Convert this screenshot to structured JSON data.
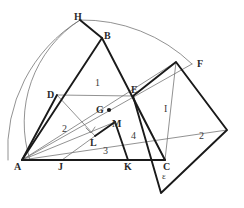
{
  "figure": {
    "type": "geometry-diagram",
    "width": 244,
    "height": 208,
    "background_color": "#ffffff",
    "stroke_color_heavy": "#1a1a1a",
    "stroke_color_light": "#6e6e6e",
    "label_color": "#2b2b2b"
  },
  "points": [
    {
      "name": "A",
      "label": "A",
      "x": 22,
      "y": 160,
      "label_x": 14,
      "label_y": 162,
      "marked": false
    },
    {
      "name": "B",
      "label": "B",
      "x": 102,
      "y": 38,
      "label_x": 104,
      "label_y": 31,
      "marked": false
    },
    {
      "name": "C",
      "label": "C",
      "x": 165,
      "y": 160,
      "label_x": 163,
      "label_y": 162,
      "marked": false
    },
    {
      "name": "D",
      "label": "D",
      "x": 57,
      "y": 95,
      "label_x": 47,
      "label_y": 90,
      "marked": false
    },
    {
      "name": "E",
      "label": "E",
      "x": 133,
      "y": 96,
      "label_x": 131,
      "label_y": 85,
      "marked": false
    },
    {
      "name": "F",
      "label": "F",
      "x": 192,
      "y": 64,
      "label_x": 197,
      "label_y": 59,
      "marked": false
    },
    {
      "name": "G",
      "label": "G",
      "x": 109,
      "y": 110,
      "label_x": 96,
      "label_y": 105,
      "marked": true
    },
    {
      "name": "H",
      "label": "H",
      "x": 80,
      "y": 20,
      "label_x": 74,
      "label_y": 12,
      "marked": false
    },
    {
      "name": "J",
      "label": "J",
      "x": 62,
      "y": 160,
      "label_x": 58,
      "label_y": 162,
      "marked": false
    },
    {
      "name": "K",
      "label": "K",
      "x": 128,
      "y": 160,
      "label_x": 124,
      "label_y": 162,
      "marked": false
    },
    {
      "name": "L",
      "label": "L",
      "x": 95,
      "y": 136,
      "label_x": 90,
      "label_y": 138,
      "marked": false
    },
    {
      "name": "M",
      "label": "M",
      "x": 115,
      "y": 122,
      "label_x": 112,
      "label_y": 119,
      "marked": false
    }
  ],
  "region_labels": [
    {
      "name": "region-1",
      "text": "1",
      "x": 95,
      "y": 78,
      "style": "region"
    },
    {
      "name": "region-2-left",
      "text": "2",
      "x": 62,
      "y": 124,
      "style": "region"
    },
    {
      "name": "region-2-right",
      "text": "2",
      "x": 199,
      "y": 131,
      "style": "region"
    },
    {
      "name": "region-3",
      "text": "3",
      "x": 103,
      "y": 146,
      "style": "region"
    },
    {
      "name": "region-4",
      "text": "4",
      "x": 131,
      "y": 131,
      "style": "region"
    },
    {
      "name": "region-I",
      "text": "I",
      "x": 164,
      "y": 104,
      "style": "region"
    },
    {
      "name": "region-epsilon",
      "text": "ε",
      "x": 162,
      "y": 172,
      "style": "greek"
    }
  ],
  "heavy_paths": [
    {
      "name": "triangle-abc",
      "d": "M 22 160 L 102 38 L 165 160 Z",
      "closed": true
    },
    {
      "name": "square-on-bc-ecfx",
      "d": "M 133 96 L 176 62 L 227 130 L 161 193 Z",
      "closed": true
    },
    {
      "name": "segment-ab-extended-to-h",
      "d": "M 102 38 L 80 20"
    },
    {
      "name": "square-on-ab-partial-ad",
      "d": "M 22 160 L 57 95"
    },
    {
      "name": "segment-k-to-m",
      "d": "M 128 160 L 115 122"
    },
    {
      "name": "segment-m-to-l",
      "d": "M 115 122 L 95 136"
    },
    {
      "name": "base-ac",
      "d": "M 22 160 L 165 160"
    }
  ],
  "light_paths": [
    {
      "name": "arc-outer-from-a",
      "d": "M 8 160 A 152 152 0 0 1 80 20"
    },
    {
      "name": "arc-inner-from-a",
      "d": "M 30 160 A 122 122 0 0 1 80 20"
    },
    {
      "name": "arc-top-h-to-f",
      "d": "M 80 20 A 158 158 0 0 1 192 64"
    },
    {
      "name": "square-adjk-top",
      "d": "M 57 95 L 95 136"
    },
    {
      "name": "square-adjk-right",
      "d": "M 95 136 L 62 160"
    },
    {
      "name": "square-adjk-left",
      "d": "M 62 160 L 22 160"
    },
    {
      "name": "line-a-to-e",
      "d": "M 22 160 L 192 64"
    },
    {
      "name": "line-a-to-f",
      "d": "M 22 160 L 176 62"
    },
    {
      "name": "line-c-to-f-inner",
      "d": "M 165 160 L 176 62"
    },
    {
      "name": "line-e-to-c-inner",
      "d": "M 133 96 L 165 160"
    },
    {
      "name": "line-g-diagonal",
      "d": "M 57 95 L 133 96"
    },
    {
      "name": "line-a-to-l-thin",
      "d": "M 22 160 L 115 122"
    },
    {
      "name": "line-right-sq-diag",
      "d": "M 176 62 L 227 130"
    },
    {
      "name": "base-ac-light",
      "d": "M 22 160 L 227 130"
    }
  ],
  "right_angle_marks": [
    {
      "name": "right-angle-at-l",
      "d": "M 86 128 L 91 133 L 95 127"
    }
  ]
}
